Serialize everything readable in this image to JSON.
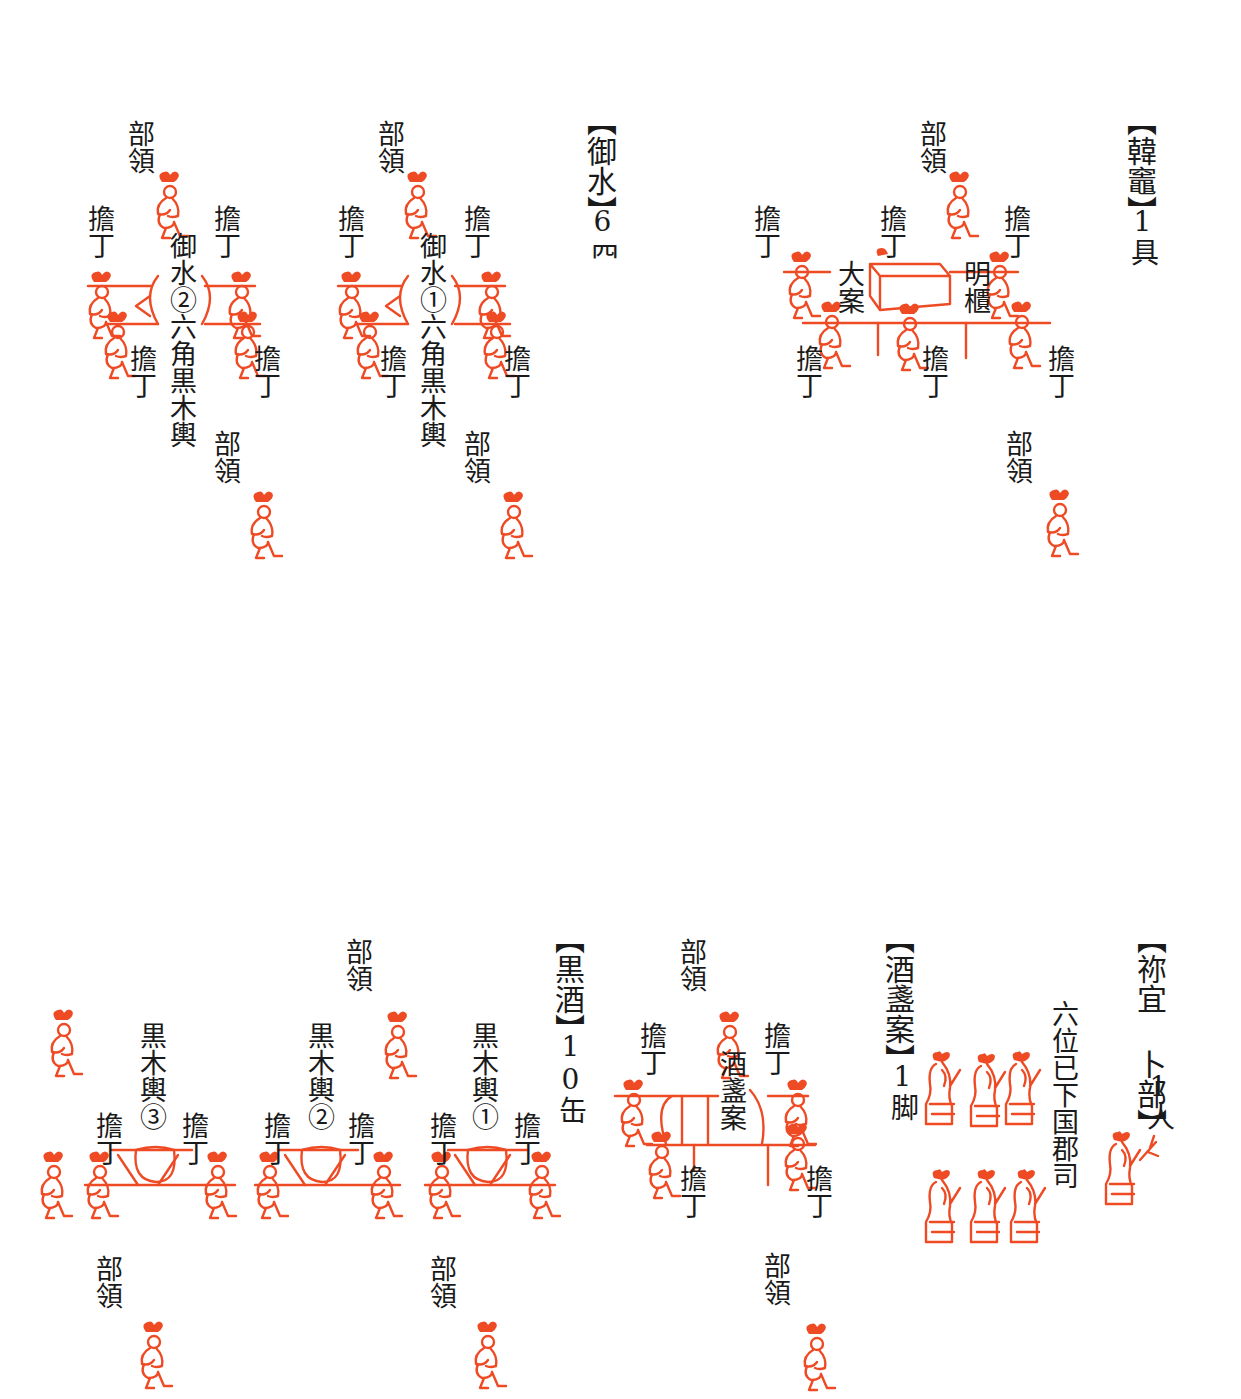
{
  "colors": {
    "ink": "#1a1a1a",
    "figure_red": "#ee4a24",
    "background": "#ffffff"
  },
  "sections": [
    {
      "id": "karakamado",
      "title": "【韓竈】",
      "count": "1具",
      "labels": {
        "leader_top": "部領",
        "leader_bottom": "部領",
        "bearer": "擔丁",
        "object_left": "大案",
        "object_right": "明櫃"
      },
      "bearer_count": 6,
      "leader_count": 2
    },
    {
      "id": "omimizu",
      "title": "【御水】",
      "count": "6𦉪",
      "groups": [
        {
          "label": "御水①六角黒木輿",
          "leader": "部領",
          "bearer": "擔丁",
          "bearers": 4,
          "leaders": 2
        },
        {
          "label": "御水②六角黒木輿",
          "leader": "部領",
          "bearer": "擔丁",
          "bearers": 4,
          "leaders": 2
        }
      ]
    },
    {
      "id": "negi_urabe",
      "title": "【祢宜 卜部】",
      "count": "1人",
      "sub_label": "六位已下国郡司",
      "officials_count": 6,
      "priest_count": 1
    },
    {
      "id": "shusanan",
      "title": "【酒盞案】",
      "count": "1脚",
      "object_label": "酒盞案",
      "labels": {
        "leader": "部領",
        "bearer": "擔丁"
      },
      "bearers": 4,
      "leaders": 2
    },
    {
      "id": "kuroki",
      "title": "【黒酒】",
      "count": "10缶",
      "groups": [
        {
          "label": "黒木輿①",
          "bearer": "擔丁"
        },
        {
          "label": "黒木輿②",
          "bearer": "擔丁"
        },
        {
          "label": "黒木輿③",
          "bearer": "擔丁"
        }
      ],
      "leader": "部領"
    }
  ]
}
